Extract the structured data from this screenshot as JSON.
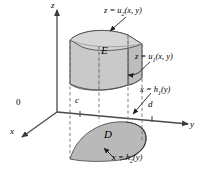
{
  "figure": {
    "axes": {
      "z_label": "z",
      "y_label": "y",
      "x_label": "x",
      "origin_label": "0"
    },
    "ticks": {
      "c": "c",
      "d": "d"
    },
    "regions": {
      "solid_label": "E",
      "base_label": "D"
    },
    "surface_labels": {
      "upper": {
        "prefix": "z = u",
        "sub": "2",
        "suffix": "(x, y)"
      },
      "lower": {
        "prefix": "z = u",
        "sub": "1",
        "suffix": "(x, y)"
      },
      "boundary_back": {
        "prefix": "x = h",
        "sub": "1",
        "suffix": "(y)"
      },
      "boundary_front": {
        "prefix": "x = h",
        "sub": "2",
        "suffix": "(y)"
      }
    },
    "colors": {
      "solid_fill": "#c9c9c9",
      "solid_top_fill": "#d6d6d6",
      "solid_side_fill": "#bdbdbd",
      "base_fill": "#b9b9b9",
      "stroke": "#3a3a3a",
      "axis": "#4a4a4a",
      "dashed": "#6e6e6e",
      "text": "#000000"
    }
  }
}
